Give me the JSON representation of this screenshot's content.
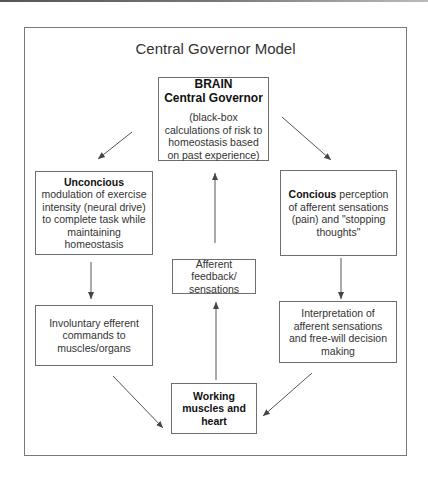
{
  "title": "Central Governor Model",
  "nodes": {
    "brain": {
      "heading_1": "BRAIN",
      "heading_2": "Central Governor",
      "description": "(black-box calculations of risk to homeostasis based on past experience)"
    },
    "unconscious": {
      "bold": "Unconcious",
      "text": " modulation of exercise intensity (neural drive) to complete task while maintaining homeostasis"
    },
    "conscious": {
      "bold": "Concious",
      "text": " perception of afferent sensations (pain) and \"stopping thoughts\""
    },
    "afferent": {
      "text": "Afferent feedback/ sensations"
    },
    "involuntary": {
      "text": "Involuntary efferent commands to muscles/organs"
    },
    "interpretation": {
      "text": "Interpretation of afferent sensations and free-will decision making"
    },
    "working": {
      "text": "Working muscles and heart"
    }
  },
  "edges": [
    {
      "from": "brain",
      "to": "unconscious"
    },
    {
      "from": "brain",
      "to": "conscious"
    },
    {
      "from": "unconscious",
      "to": "involuntary"
    },
    {
      "from": "conscious",
      "to": "interpretation"
    },
    {
      "from": "involuntary",
      "to": "working"
    },
    {
      "from": "interpretation",
      "to": "working"
    },
    {
      "from": "working",
      "to": "afferent"
    },
    {
      "from": "afferent",
      "to": "brain"
    }
  ],
  "colors": {
    "line": "#6e6e6e",
    "arrow": "#444444",
    "text": "#333333"
  }
}
